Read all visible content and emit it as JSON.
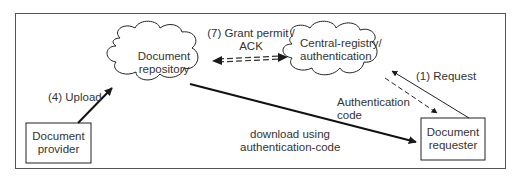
{
  "nodes": {
    "repository": {
      "line1": "Document",
      "line2": "repository"
    },
    "registry": {
      "line1": "Central-registry/",
      "line2": "authentication"
    },
    "provider": {
      "line1": "Document",
      "line2": "provider"
    },
    "requester": {
      "line1": "Document",
      "line2": "requester"
    }
  },
  "edges": {
    "grant": {
      "line1": "(7) Grant permit /",
      "line2": "ACK"
    },
    "request": {
      "label": "(1) Request"
    },
    "auth_code": {
      "line1": "Authentication",
      "line2": "code"
    },
    "upload": {
      "label": "(4) Upload"
    },
    "download": {
      "line1": "download using",
      "line2": "authentication-code"
    }
  },
  "colors": {
    "stroke": "#1a1a1a",
    "text": "#333333",
    "frame": "#555555"
  }
}
